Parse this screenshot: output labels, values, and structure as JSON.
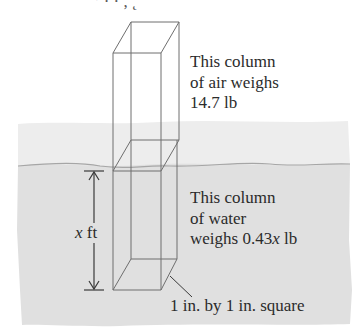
{
  "diagram": {
    "top_fragment": "’    · ·     ,            ˛",
    "air_label": {
      "lines": [
        "This column",
        "of air weighs",
        "14.7 lb"
      ]
    },
    "water_label": {
      "line1": "This column",
      "line2": "of water",
      "line3_prefix": "weighs 0.43",
      "line3_var": "x",
      "line3_suffix": " lb"
    },
    "depth_label": {
      "var": "x",
      "unit": " ft"
    },
    "square_label": "1 in. by 1 in. square",
    "colors": {
      "background": "#ffffff",
      "air_region": "#ededed",
      "water_region": "#e0e0e0",
      "water_surface": "#a6a6a6",
      "box_lines": "#6e6e6e",
      "arrow": "#3a3a3a",
      "text": "#2b2b2b"
    }
  }
}
